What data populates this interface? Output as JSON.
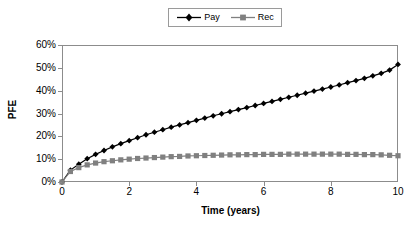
{
  "chart_data": {
    "type": "line",
    "title": "",
    "xlabel": "Time (years)",
    "ylabel": "PFE",
    "xlim": [
      0,
      10
    ],
    "ylim": [
      0,
      0.6
    ],
    "grid": false,
    "legend_position": "top-center",
    "x_tick_labels": [
      "0",
      "2",
      "4",
      "6",
      "8",
      "10"
    ],
    "x_tick_values": [
      0,
      2,
      4,
      6,
      8,
      10
    ],
    "y_tick_labels": [
      "0%",
      "10%",
      "20%",
      "30%",
      "40%",
      "50%",
      "60%"
    ],
    "y_tick_values": [
      0,
      10,
      20,
      30,
      40,
      50,
      60
    ],
    "x": [
      0,
      0.25,
      0.5,
      0.75,
      1,
      1.25,
      1.5,
      1.75,
      2,
      2.25,
      2.5,
      2.75,
      3,
      3.25,
      3.5,
      3.75,
      4,
      4.25,
      4.5,
      4.75,
      5,
      5.25,
      5.5,
      5.75,
      6,
      6.25,
      6.5,
      6.75,
      7,
      7.25,
      7.5,
      7.75,
      8,
      8.25,
      8.5,
      8.75,
      9,
      9.25,
      9.5,
      9.75,
      10
    ],
    "series": [
      {
        "name": "Pay",
        "marker": "diamond",
        "color": "#000000",
        "values": [
          0,
          5.2,
          7.8,
          10.2,
          12.1,
          13.8,
          15.4,
          16.8,
          18.1,
          19.4,
          20.7,
          21.8,
          22.9,
          24.0,
          25.0,
          26.0,
          27.0,
          28.0,
          29.0,
          29.9,
          30.8,
          31.7,
          32.6,
          33.5,
          34.4,
          35.3,
          36.2,
          37.1,
          38.0,
          38.9,
          39.8,
          40.7,
          41.6,
          42.5,
          43.5,
          44.4,
          45.4,
          46.5,
          47.6,
          49.0,
          51.5
        ]
      },
      {
        "name": "Rec",
        "marker": "square",
        "color": "#808080",
        "values": [
          0,
          4.6,
          6.3,
          7.5,
          8.3,
          8.9,
          9.3,
          9.7,
          10.0,
          10.3,
          10.5,
          10.7,
          10.9,
          11.1,
          11.2,
          11.4,
          11.5,
          11.6,
          11.7,
          11.8,
          11.9,
          11.9,
          12.0,
          12.0,
          12.1,
          12.1,
          12.1,
          12.2,
          12.2,
          12.2,
          12.2,
          12.2,
          12.2,
          12.2,
          12.1,
          12.1,
          12.0,
          12.0,
          11.9,
          11.7,
          11.5
        ]
      }
    ]
  },
  "legend": {
    "entries": [
      {
        "label": "Pay"
      },
      {
        "label": "Rec"
      }
    ]
  },
  "colors": {
    "pay": "#000000",
    "rec": "#808080",
    "axis": "#8c8c8c",
    "background": "#ffffff"
  }
}
